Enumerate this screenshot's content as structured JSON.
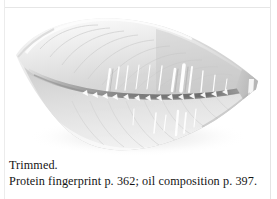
{
  "figure": {
    "kind": "photograph",
    "alt": "Pale skinless fish fillet, trimmed, viewed from above on white background",
    "frame_color": "#e6e6e6",
    "background_color": "#ffffff"
  },
  "caption": {
    "line1": "Trimmed.",
    "line2": "Protein fingerprint p. 362; oil composition p. 397.",
    "text_color": "#151515",
    "cross_references": [
      {
        "label": "Protein fingerprint",
        "page": "362"
      },
      {
        "label": "oil composition",
        "page": "397"
      }
    ]
  }
}
